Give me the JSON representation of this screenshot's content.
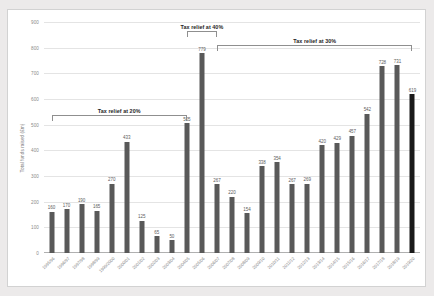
{
  "chart_data": {
    "type": "bar",
    "title": "",
    "xlabel": "",
    "ylabel": "Total funds raised (£m)",
    "ylim": [
      0,
      900
    ],
    "ytick_step": 100,
    "yticks": [
      "0",
      "100",
      "200",
      "300",
      "400",
      "500",
      "600",
      "700",
      "800",
      "900"
    ],
    "grid": true,
    "legend": "none",
    "bar_color": "#595959",
    "highlight_color": "#1a1a1a",
    "categories": [
      "1995/96",
      "1996/97",
      "1997/98",
      "1998/99",
      "1999/2000",
      "2000/01",
      "2001/02",
      "2002/03",
      "2003/04",
      "2004/05",
      "2005/06",
      "2006/07",
      "2007/08",
      "2008/09",
      "2009/10",
      "2010/11",
      "2011/12",
      "2012/13",
      "2013/14",
      "2014/15",
      "2015/16",
      "2016/17",
      "2017/18",
      "2018/19",
      "2019/20"
    ],
    "values": [
      160,
      170,
      190,
      165,
      270,
      433,
      125,
      65,
      50,
      505,
      779,
      267,
      220,
      154,
      338,
      354,
      267,
      269,
      420,
      429,
      457,
      542,
      728,
      731,
      619
    ],
    "highlight_index": 24,
    "annotations": [
      {
        "label": "Tax relief at 20%",
        "start_index": 0,
        "end_index": 9
      },
      {
        "label": "Tax relief at 40%",
        "start_index": 9,
        "end_index": 11
      },
      {
        "label": "Tax relief at 30%",
        "start_index": 11,
        "end_index": 24
      }
    ]
  }
}
